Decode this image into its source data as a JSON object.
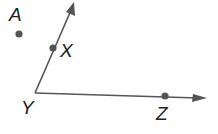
{
  "diagram": {
    "type": "geometry-angle",
    "colors": {
      "line": "#555555",
      "point": "#555555",
      "label": "#222222"
    },
    "points": [
      {
        "id": "A",
        "label": "A",
        "x": 19,
        "y": 34,
        "lx": 9,
        "ly": 5
      },
      {
        "id": "X",
        "label": "X",
        "x": 53,
        "y": 48,
        "lx": 60,
        "ly": 41
      },
      {
        "id": "Y",
        "label": "Y",
        "x": 35,
        "y": 93,
        "lx": 21,
        "ly": 98
      },
      {
        "id": "Z",
        "label": "Z",
        "x": 165,
        "y": 96,
        "lx": 156,
        "ly": 104
      }
    ],
    "rays": [
      {
        "name": "ray-YX",
        "from": "Y",
        "to": [
          74,
          3
        ]
      },
      {
        "name": "ray-YZ",
        "from": "Y",
        "to": [
          206,
          98
        ]
      }
    ]
  }
}
